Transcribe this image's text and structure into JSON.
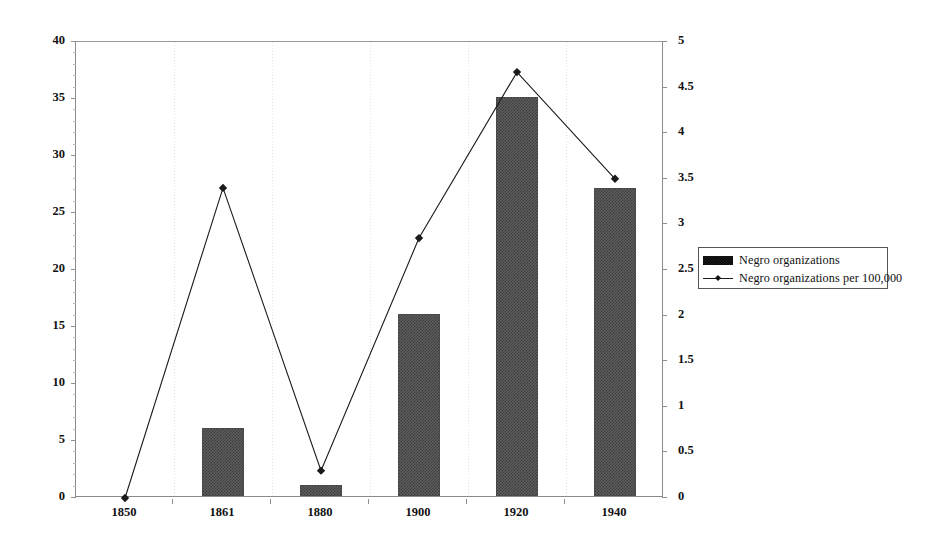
{
  "chart_data": {
    "type": "bar",
    "title": "",
    "subtitle": "",
    "xlabel": "",
    "ylabel": "",
    "categories": [
      "1850",
      "1861",
      "1880",
      "1900",
      "1920",
      "1940"
    ],
    "grid": false,
    "legend_position": "right",
    "series": [
      {
        "name": "Negro organizations",
        "type": "bar",
        "axis": "left",
        "values": [
          0,
          6,
          1,
          16,
          35,
          27
        ]
      },
      {
        "name": "Negro organizations per 100,000",
        "type": "line",
        "axis": "right",
        "values": [
          0,
          3.4,
          0.3,
          2.85,
          4.67,
          3.5
        ]
      }
    ],
    "axes": {
      "left": {
        "ylim": [
          0,
          40
        ],
        "tick_step": 5,
        "ticks": [
          "0",
          "5",
          "10",
          "15",
          "20",
          "25",
          "30",
          "35",
          "40"
        ]
      },
      "right": {
        "ylim": [
          0,
          5
        ],
        "tick_step": 0.5,
        "ticks": [
          "0",
          "0.5",
          "1",
          "1.5",
          "2",
          "2.5",
          "3",
          "3.5",
          "4",
          "4.5",
          "5"
        ]
      }
    },
    "colors": {
      "bar_fill": "#5e5e5e",
      "line": "#1a1a1a",
      "axis": "#8f8f8f",
      "background": "#ffffff"
    }
  },
  "legend": {
    "items": [
      {
        "label": "Negro organizations",
        "marker": "bar-swatch"
      },
      {
        "label": "Negro organizations per 100,000",
        "marker": "line-diamond-swatch"
      }
    ]
  }
}
